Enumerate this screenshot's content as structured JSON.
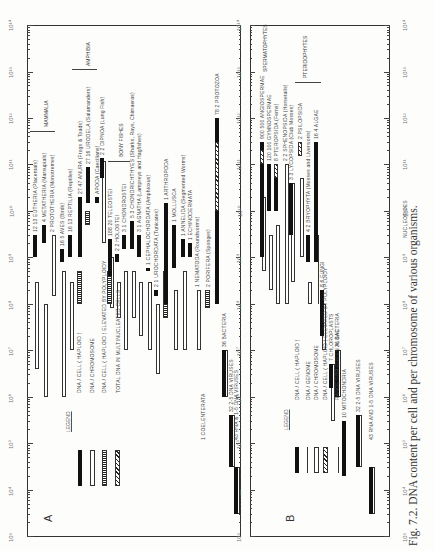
{
  "caption": "Fig. 7.2. DNA content per cell and per chromosome of various organisms.",
  "chart_data": [
    {
      "type": "bar",
      "panel": "A",
      "orientation": "rotated-90",
      "axis": {
        "scale": "log",
        "range": [
          1000.0,
          100000000000000.0
        ],
        "tick_labels": [
          "10^3",
          "10^4",
          "10^5",
          "10^6",
          "10^7",
          "10^8",
          "10^9",
          "10^10",
          "10^11",
          "10^12",
          "10^13",
          "10^14"
        ]
      },
      "legend": {
        "title": "LEGEND",
        "entries": [
          {
            "style": "solid",
            "label": "DNA / CELL ( HAPLOID )"
          },
          {
            "style": "open",
            "label": "DNA / CHROMOSOME"
          },
          {
            "style": "checker",
            "label": "DNA / CELL ( HAPLOID ) ELEVATED BY POLYPLOIDY"
          },
          {
            "style": "hatch",
            "label": "TOTAL DNA IN MULTINUCLEATED CELLS"
          }
        ]
      },
      "groups": [
        {
          "label": "MAMMALIA"
        },
        {
          "label": "AMPHIBIA"
        },
        {
          "label": "BONY FISHES"
        }
      ],
      "series": [
        {
          "name": "EUTHERIA (Placentals)",
          "n": "12/13",
          "cell": [
            1000000000.0,
            3000000000.0
          ],
          "chrom": [
            4000000.0,
            300000000.0
          ]
        },
        {
          "name": "METATHERIA (Marsupials)",
          "n": "4",
          "cell": [
            2000000000.0,
            5000000000.0
          ],
          "chrom": [
            1000000.0,
            100000000.0
          ]
        },
        {
          "name": "PROTOTHERIA (Monotremes)",
          "n": "2",
          "chrom": [
            150000000.0,
            3000000000.0
          ]
        },
        {
          "name": "AVES (Birds)",
          "n": "16/5",
          "cell": [
            800000000.0,
            1500000000.0
          ],
          "chrom": [
            1000000.0,
            500000000.0
          ]
        },
        {
          "name": "REPTILIA (Reptiles)",
          "n": "16/13",
          "cell": [
            1000000000.0,
            3000000000.0
          ],
          "chrom": [
            10000000.0,
            300000000.0
          ]
        },
        {
          "name": "ANURA (Frogs & Toads)",
          "n": "27/47",
          "cell": [
            1000000000.0,
            20000000000.0
          ],
          "checker": [
            100000000.0,
            500000000.0
          ]
        },
        {
          "name": "URODELA (Salamanders)",
          "n": "27/16",
          "cell": [
            15000000000.0,
            90000000000.0
          ],
          "checker": [
            5000000000.0,
            10000000000.0
          ]
        },
        {
          "name": "APODA (Caecilians)",
          "cell": [
            15000000000.0,
            20000000000.0
          ]
        },
        {
          "name": "DIPNOA (Lung Fish)",
          "n": "2/2",
          "cell": [
            50000000000.0,
            140000000000.0
          ],
          "chrom": [
            2000000000.0,
            120000000000.0
          ]
        },
        {
          "name": "TELEOSTEI",
          "n": "188/20",
          "cell": [
            400000000.0,
            2500000000.0
          ],
          "chrom": [
            80000000.0,
            1000000000.0
          ],
          "checker": [
            100000000.0,
            500000000.0
          ]
        },
        {
          "name": "HOLOSTEI",
          "n": "2/2",
          "cell": [
            800000000.0,
            1200000000.0
          ],
          "chrom": [
            50000000.0,
            300000000.0
          ]
        },
        {
          "name": "CHONDROSTEI",
          "n": "3/1",
          "cell": [
            1500000000.0,
            3000000000.0
          ],
          "chrom": [
            10000000.0,
            500000000.0
          ]
        },
        {
          "name": "CHONDRICHTHYES (Sharks, Rays, Chimaeras)",
          "n": "5/3",
          "cell": [
            1500000000.0,
            6000000000.0
          ],
          "chrom": [
            50000000.0,
            500000000.0
          ]
        },
        {
          "name": "AGNATHA (Lampreys and Hagfishes)",
          "n": "3/1",
          "cell": [
            1000000000.0,
            3000000000.0
          ],
          "chrom": [
            20000000.0,
            300000000.0
          ]
        },
        {
          "name": "CEPHALOCHORDATA (Amphioxus)",
          "n": "1",
          "cell": [
            500000000.0,
            600000000.0
          ],
          "chrom": [
            10000000.0,
            300000000.0
          ]
        },
        {
          "name": "UROCHORDATA (Tunicates)",
          "n": "2/1",
          "cell": [
            150000000.0,
            200000000.0
          ],
          "chrom": [
            3000000.0,
            100000000.0
          ]
        },
        {
          "name": "ARTHROPODA",
          "n": "1",
          "cell": [
            100000000.0,
            15000000000.0
          ],
          "checker": [
            50000000.0,
            500000000.0
          ]
        },
        {
          "name": "MOLLUSCA",
          "n": "1",
          "cell": [
            600000000.0,
            5000000000.0
          ],
          "chrom": [
            10000000.0,
            200000000.0
          ]
        },
        {
          "name": "ANNELIDA (Segmented Worms)",
          "n": "1",
          "cell": [
            1000000000.0,
            2500000000.0
          ],
          "chrom": [
            10000000.0,
            500000000.0
          ]
        },
        {
          "name": "ECHINODERMATA",
          "n": "1",
          "cell": [
            1000000000.0,
            2000000000.0
          ]
        },
        {
          "name": "NEMATODA (Roundworms)",
          "n": "1",
          "chrom": [
            10000000.0,
            200000000.0
          ]
        },
        {
          "name": "COELENTERATA",
          "n": "1"
        },
        {
          "name": "PORIFERA (Sponges)",
          "n": "2",
          "checker": [
            80000000.0,
            200000000.0
          ]
        },
        {
          "name": "PROTOZOA",
          "n": "78/2",
          "cell": [
            100000000.0,
            1000000000000.0
          ],
          "hatch": [
            10000000000.0,
            300000000000.0
          ]
        },
        {
          "name": "BACTERIA",
          "n": "36",
          "cell": [
            1000000.0,
            10000000.0
          ],
          "chrom": [
            1000000.0,
            10000000.0
          ]
        },
        {
          "name": "2-5 DNA VIRUSES",
          "n": "32",
          "cell": [
            30000.0,
            400000.0
          ],
          "chrom": [
            30000.0,
            400000.0
          ]
        },
        {
          "name": "RNA & 1-5 DNA VIRUSES",
          "n": "43",
          "cell": [
            3000.0,
            30000.0
          ],
          "chrom": [
            3000.0,
            30000.0
          ]
        }
      ]
    },
    {
      "type": "bar",
      "panel": "B",
      "orientation": "rotated-90",
      "axis": {
        "scale": "log",
        "range": [
          1000.0,
          100000000000000.0
        ],
        "tick_labels": [
          "10^3",
          "10^4",
          "10^5",
          "10^6",
          "10^7",
          "10^8",
          "10^9",
          "10^10",
          "10^11",
          "10^12",
          "10^13",
          "10^14"
        ],
        "secondary_label": "NUCLEOTIDES",
        "secondary_ticks": [
          "10^-18",
          "10^-17",
          "10^-16",
          "10^-15",
          "10^-14",
          "10^-13",
          "10^-12",
          "10^-11",
          "10^-10"
        ]
      },
      "legend": {
        "title": "LEGEND",
        "entries": [
          {
            "style": "solid",
            "label": "DNA / CELL ( HAPLOID )"
          },
          {
            "style": "genome",
            "label": "DNA / GENOME"
          },
          {
            "style": "open",
            "label": "DNA / CHROMOSOME"
          },
          {
            "style": "hatch",
            "label": "DNA / CELL ( HAPLOID ) ELEVATED BY POLYPLOIDY"
          },
          {
            "style": "range",
            "label": "RANGE FOR GREEN ALGAE"
          }
        ]
      },
      "groups": [
        {
          "label": "SPERMATOPHYTES"
        },
        {
          "label": "PTERIDOPHYTES"
        }
      ],
      "series": [
        {
          "name": "ANGIOSPERMAE",
          "n": "900/500",
          "cell": [
            1000000000.0,
            300000000000.0
          ],
          "chrom": [
            500000000.0,
            20000000000.0
          ],
          "hatch": [
            100000000000.0,
            200000000000.0
          ]
        },
        {
          "name": "GYMNOSPERMAE",
          "n": "120/100",
          "cell": [
            10000000000.0,
            100000000000.0
          ],
          "chrom": [
            200000000.0,
            3000000000.0
          ]
        },
        {
          "name": "PTEROPSIDA (Ferns)",
          "n": "8",
          "cell": [
            10000000000.0,
            100000000000.0
          ],
          "chrom": [
            100000000.0,
            5000000000.0
          ],
          "hatch": [
            50000000000.0,
            100000000000.0
          ]
        },
        {
          "name": "SPHENOPSIDA (Horsetails)",
          "n": "2/2",
          "chrom": [
            100000000.0,
            100000000000.0
          ]
        },
        {
          "name": "LYCOPSIDA (Club Mosses)",
          "n": "3/3",
          "cell": [
            3000000000.0,
            40000000000.0
          ],
          "chrom": [
            300000000.0,
            40000000000.0
          ]
        },
        {
          "name": "PSILOPSIDA",
          "n": "2",
          "hatch": [
            150000000000.0,
            300000000000.0
          ],
          "chrom": [
            1000000000.0,
            50000000000.0
          ]
        },
        {
          "name": "BRYOPHYTA (Mosses and Liverworts)",
          "n": "4/2",
          "cell": [
            800000000.0,
            3000000000.0
          ],
          "chrom": [
            100000000.0,
            300000000.0
          ]
        },
        {
          "name": "ALGAE",
          "n": "16/4",
          "cell": [
            800000000.0,
            300000000000.0
          ],
          "range": [
            100000000.0,
            3000000000.0
          ]
        },
        {
          "name": "FUNGI",
          "n": "8/6",
          "cell": [
            20000000.0,
            200000000.0
          ],
          "chrom": [
            10000000.0,
            100000000.0
          ]
        },
        {
          "name": "CHLOROPLASTS",
          "n": "7",
          "cell": [
            1500000.0,
            5000000.0
          ],
          "chrom": [
            300000.0,
            5000000.0
          ]
        },
        {
          "name": "BACTERIA",
          "n": "36",
          "cell": [
            1000000.0,
            10000000.0
          ],
          "chrom": [
            1000000.0,
            10000000.0
          ]
        },
        {
          "name": "MITOCHONDRIA",
          "n": "10",
          "cell": [
            20000.0,
            300000.0
          ]
        },
        {
          "name": "2-5 DNA VIRUSES",
          "n": "32",
          "cell": [
            30000.0,
            400000.0
          ],
          "chrom": [
            30000.0,
            400000.0
          ]
        },
        {
          "name": "RNA AND 1-5 DNA VIRUSES",
          "n": "43",
          "cell": [
            3000.0,
            30000.0
          ],
          "chrom": [
            3000.0,
            30000.0
          ]
        }
      ]
    }
  ],
  "panels": {
    "A": {
      "letter": "A",
      "legend_title": "LEGEND",
      "legend": [
        "DNA / CELL ( HAPLOID )",
        "DNA / CHROMOSOME",
        "DNA / CELL ( HAPLOID ) ELEVATED BY POLYPLOIDY",
        "TOTAL DNA IN MULTINUCLEATED CELLS"
      ],
      "groups": {
        "mammalia": "MAMMALIA",
        "amphibia": "AMPHIBIA",
        "bony": "BONY FISHES"
      }
    },
    "B": {
      "letter": "B",
      "legend_title": "LEGEND",
      "legend": [
        "DNA / CELL ( HAPLOID )",
        "DNA / GENOME",
        "DNA / CHROMOSOME",
        "DNA / CELL ( HAPLOID ) ELEVATED BY POLYPLOIDY",
        "RANGE FOR GREEN ALGAE"
      ],
      "groups": {
        "sperm": "SPERMATOPHYTES",
        "pter": "PTERIDOPHYTES"
      },
      "secondary_label": "NUCLEOTIDES"
    }
  },
  "ticks": [
    "10³",
    "10⁴",
    "10⁵",
    "10⁶",
    "10⁷",
    "10⁸",
    "10⁹",
    "10¹⁰",
    "10¹¹",
    "10¹²",
    "10¹³",
    "10¹⁴"
  ],
  "ticks_b_right": [
    "10⁻¹⁸",
    "10⁻¹⁷",
    "10⁻¹⁶",
    "10⁻¹⁵",
    "10⁻¹⁴",
    "10⁻¹³",
    "10⁻¹²",
    "10⁻¹¹",
    "10⁻¹⁰"
  ]
}
